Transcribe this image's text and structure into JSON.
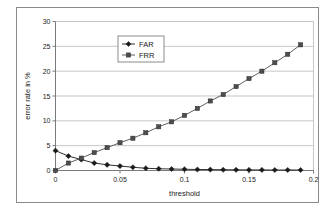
{
  "chart_data": {
    "type": "line",
    "title": "",
    "xlabel": "threshold",
    "ylabel": "error rate in %",
    "xlim": [
      0,
      0.2
    ],
    "ylim": [
      0,
      30
    ],
    "xticks": [
      0,
      0.05,
      0.1,
      0.15,
      0.2
    ],
    "xticklabels": [
      "0",
      "0.05",
      "0.1",
      "0.15",
      "0.2"
    ],
    "yticks": [
      0,
      5,
      10,
      15,
      20,
      25,
      30
    ],
    "yticklabels": [
      "0",
      "5",
      "10",
      "15",
      "20",
      "25",
      "30"
    ],
    "grid": "horizontal",
    "legend_position": "upper-center-left",
    "x": [
      0,
      0.01,
      0.02,
      0.03,
      0.04,
      0.05,
      0.06,
      0.07,
      0.08,
      0.09,
      0.1,
      0.11,
      0.12,
      0.13,
      0.14,
      0.15,
      0.16,
      0.17,
      0.18,
      0.19
    ],
    "series": [
      {
        "name": "FAR",
        "marker": "diamond",
        "color": "#1a1a1a",
        "values": [
          4.0,
          2.9,
          2.2,
          1.5,
          1.15,
          0.9,
          0.65,
          0.45,
          0.35,
          0.3,
          0.25,
          0.2,
          0.18,
          0.15,
          0.14,
          0.12,
          0.11,
          0.1,
          0.1,
          0.1
        ]
      },
      {
        "name": "FRR",
        "marker": "square",
        "color": "#4d4d4d",
        "values": [
          0.0,
          1.5,
          2.5,
          3.6,
          4.6,
          5.6,
          6.5,
          7.6,
          8.8,
          9.8,
          11.1,
          12.5,
          14.0,
          15.3,
          16.9,
          18.5,
          20.0,
          21.7,
          23.4,
          25.3
        ]
      }
    ],
    "annotations": [
      {
        "label": "equal-error-rate crossover",
        "x": 0.02,
        "y": 2.35
      }
    ]
  },
  "legend": {
    "entries": [
      {
        "label": "FAR"
      },
      {
        "label": "FRR"
      }
    ]
  },
  "axes": {
    "x_title": "threshold",
    "y_title": "error rate in %"
  }
}
